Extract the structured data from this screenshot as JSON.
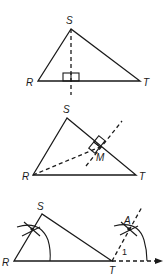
{
  "figures": [
    {
      "id": "altitude",
      "description": "Triangle RST with dashed altitude from S perpendicular to RT",
      "labels": {
        "top": "S",
        "left": "R",
        "right": "T"
      }
    },
    {
      "id": "perpendicular-to-side",
      "description": "Triangle RST with dashed segment from R to M on ST and a dashed line through M perpendicular to ST",
      "labels": {
        "top": "S",
        "left": "R",
        "right": "T",
        "foot": "M"
      }
    },
    {
      "id": "copy-angle-construction",
      "description": "Triangle RST with compass arcs at R and T; ray from T through A forms angle 1 copied from angle R",
      "labels": {
        "top": "S",
        "left": "R",
        "right": "T",
        "point": "A",
        "angle": "1"
      }
    }
  ],
  "colors": {
    "stroke": "#1a1a1a",
    "background": "#ffffff"
  }
}
